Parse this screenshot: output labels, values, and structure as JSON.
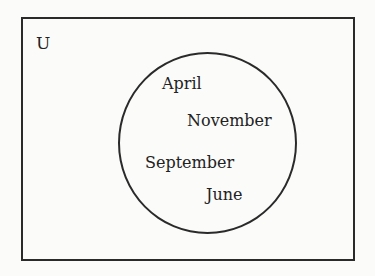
{
  "diagram": {
    "type": "venn",
    "universe_label": "U",
    "sets": [
      {
        "name": "set-a",
        "elements": [
          {
            "label": "April",
            "x": 162,
            "y": 76
          },
          {
            "label": "November",
            "x": 187,
            "y": 113
          },
          {
            "label": "September",
            "x": 145,
            "y": 155
          },
          {
            "label": "June",
            "x": 206,
            "y": 187
          }
        ]
      }
    ]
  }
}
